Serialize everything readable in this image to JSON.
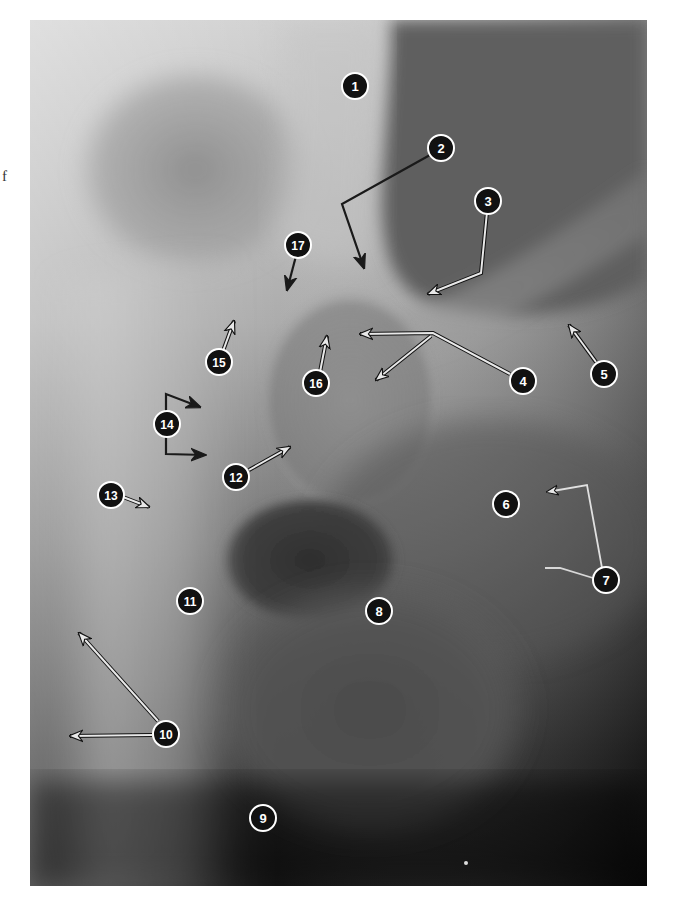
{
  "page": {
    "margin_text": "f",
    "figure_type": "hip-radiograph"
  },
  "figure": {
    "markers": [
      {
        "id": "1",
        "label": "1",
        "x": 355,
        "y": 86
      },
      {
        "id": "2",
        "label": "2",
        "x": 441,
        "y": 148
      },
      {
        "id": "3",
        "label": "3",
        "x": 488,
        "y": 201
      },
      {
        "id": "4",
        "label": "4",
        "x": 523,
        "y": 381
      },
      {
        "id": "5",
        "label": "5",
        "x": 604,
        "y": 374
      },
      {
        "id": "6",
        "label": "6",
        "x": 506,
        "y": 504
      },
      {
        "id": "7",
        "label": "7",
        "x": 606,
        "y": 580
      },
      {
        "id": "8",
        "label": "8",
        "x": 379,
        "y": 611
      },
      {
        "id": "9",
        "label": "9",
        "x": 263,
        "y": 818
      },
      {
        "id": "10",
        "label": "10",
        "x": 166,
        "y": 734
      },
      {
        "id": "11",
        "label": "11",
        "x": 190,
        "y": 601
      },
      {
        "id": "12",
        "label": "12",
        "x": 236,
        "y": 477
      },
      {
        "id": "13",
        "label": "13",
        "x": 111,
        "y": 495
      },
      {
        "id": "14",
        "label": "14",
        "x": 167,
        "y": 424
      },
      {
        "id": "15",
        "label": "15",
        "x": 219,
        "y": 362
      },
      {
        "id": "16",
        "label": "16",
        "x": 316,
        "y": 383
      },
      {
        "id": "17",
        "label": "17",
        "x": 298,
        "y": 245
      }
    ],
    "colors": {
      "marker_fill": "#111111",
      "marker_outline": "#ffffff",
      "arrow_light": "#e8e8e8",
      "arrow_dark": "#1a1a1a"
    }
  }
}
